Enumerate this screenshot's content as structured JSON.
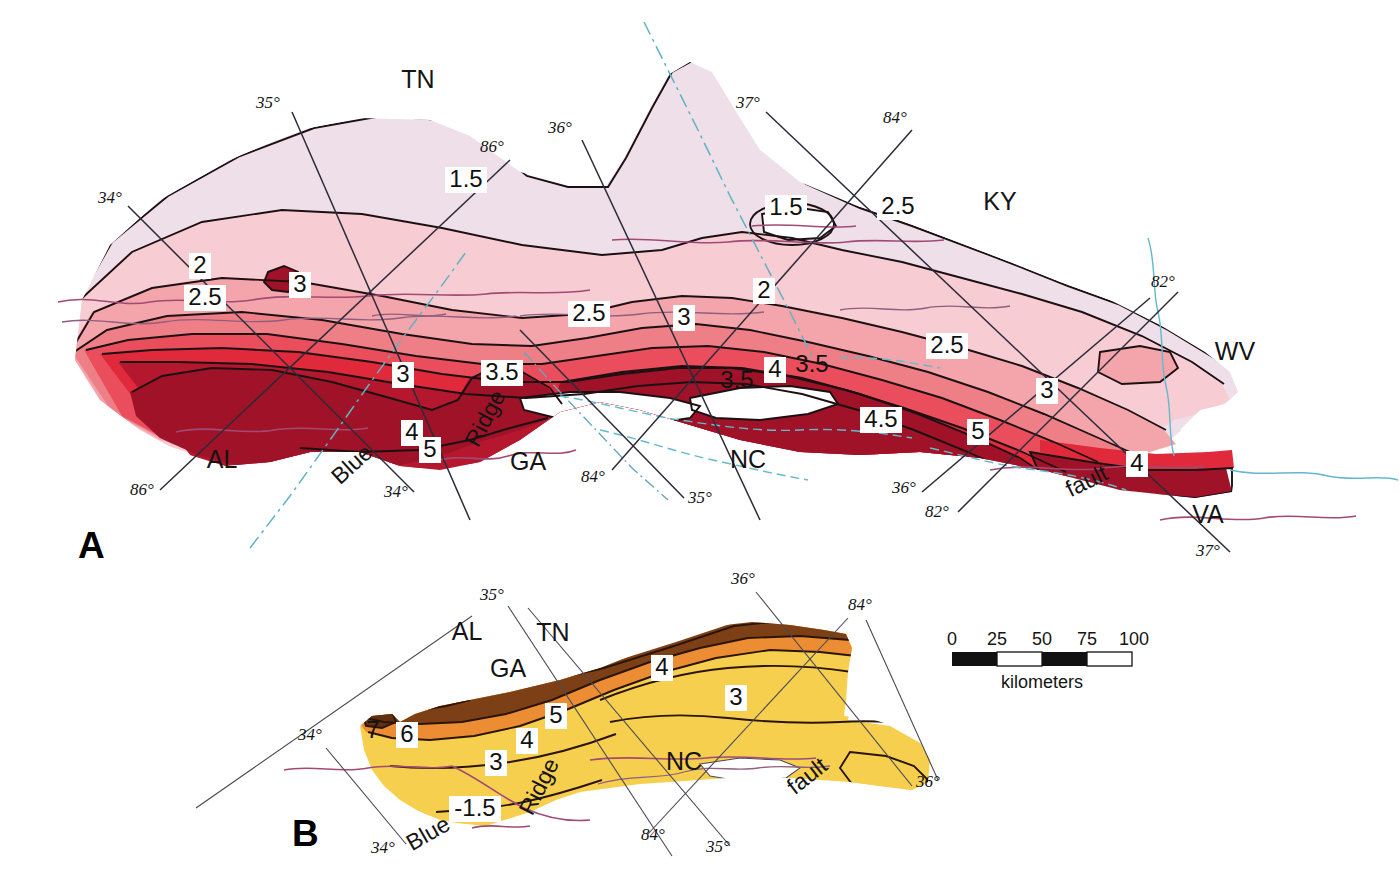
{
  "figure": {
    "type": "geologic-contour-map",
    "panels": [
      {
        "id": "A",
        "label": "A",
        "description": "Appalachian region isopach / thickness contour map, red color ramp",
        "state_labels": [
          {
            "text": "TN",
            "x": 418,
            "y": 88
          },
          {
            "text": "KY",
            "x": 1000,
            "y": 210
          },
          {
            "text": "WV",
            "x": 1235,
            "y": 360
          },
          {
            "text": "AL",
            "x": 222,
            "y": 468
          },
          {
            "text": "GA",
            "x": 528,
            "y": 470
          },
          {
            "text": "NC",
            "x": 748,
            "y": 468
          },
          {
            "text": "VA",
            "x": 1208,
            "y": 523
          }
        ],
        "feature_labels": [
          {
            "text": "Blue",
            "x": 357,
            "y": 470,
            "rotate": -42
          },
          {
            "text": "Ridge",
            "x": 492,
            "y": 422,
            "rotate": -62
          },
          {
            "text": "fault",
            "x": 1090,
            "y": 488,
            "rotate": -26
          }
        ],
        "degree_labels": [
          {
            "text": "35°",
            "x": 268,
            "y": 108
          },
          {
            "text": "86°",
            "x": 492,
            "y": 152
          },
          {
            "text": "36°",
            "x": 560,
            "y": 133
          },
          {
            "text": "37°",
            "x": 748,
            "y": 108
          },
          {
            "text": "84°",
            "x": 895,
            "y": 123
          },
          {
            "text": "34°",
            "x": 110,
            "y": 203
          },
          {
            "text": "82°",
            "x": 1163,
            "y": 287
          },
          {
            "text": "86°",
            "x": 142,
            "y": 495
          },
          {
            "text": "34°",
            "x": 396,
            "y": 497
          },
          {
            "text": "84°",
            "x": 593,
            "y": 482
          },
          {
            "text": "35°",
            "x": 700,
            "y": 503
          },
          {
            "text": "36°",
            "x": 904,
            "y": 493
          },
          {
            "text": "82°",
            "x": 937,
            "y": 517
          },
          {
            "text": "37°",
            "x": 1208,
            "y": 556
          }
        ],
        "contour_labels": [
          {
            "value": "1.5",
            "x": 465,
            "y": 182
          },
          {
            "value": "1.5",
            "x": 786,
            "y": 210
          },
          {
            "value": "2.5",
            "x": 898,
            "y": 209
          },
          {
            "value": "2",
            "x": 200,
            "y": 268
          },
          {
            "value": "3",
            "x": 300,
            "y": 287
          },
          {
            "value": "2.5",
            "x": 205,
            "y": 300
          },
          {
            "value": "2.5",
            "x": 589,
            "y": 316
          },
          {
            "value": "3",
            "x": 684,
            "y": 320
          },
          {
            "value": "2",
            "x": 764,
            "y": 293
          },
          {
            "value": "2.5",
            "x": 947,
            "y": 348
          },
          {
            "value": "3",
            "x": 403,
            "y": 377
          },
          {
            "value": "3.5",
            "x": 502,
            "y": 375
          },
          {
            "value": "3.5",
            "x": 737,
            "y": 383
          },
          {
            "value": "4",
            "x": 775,
            "y": 372
          },
          {
            "value": "3.5",
            "x": 812,
            "y": 367
          },
          {
            "value": "3",
            "x": 1047,
            "y": 393
          },
          {
            "value": "4",
            "x": 412,
            "y": 435
          },
          {
            "value": "5",
            "x": 430,
            "y": 452
          },
          {
            "value": "4.5",
            "x": 881,
            "y": 422
          },
          {
            "value": "5",
            "x": 978,
            "y": 434
          },
          {
            "value": "4",
            "x": 1137,
            "y": 466
          }
        ]
      },
      {
        "id": "B",
        "label": "B",
        "description": "Southern Appalachian thickness contour map, brown-orange-yellow color ramp",
        "state_labels": [
          {
            "text": "AL",
            "x": 467,
            "y": 640
          },
          {
            "text": "TN",
            "x": 553,
            "y": 641
          },
          {
            "text": "GA",
            "x": 508,
            "y": 677
          },
          {
            "text": "NC",
            "x": 684,
            "y": 770
          }
        ],
        "feature_labels": [
          {
            "text": "Blue",
            "x": 432,
            "y": 840,
            "rotate": -30
          },
          {
            "text": "Ridge",
            "x": 546,
            "y": 790,
            "rotate": -63
          },
          {
            "text": "fault",
            "x": 812,
            "y": 782,
            "rotate": -38
          }
        ],
        "degree_labels": [
          {
            "text": "35°",
            "x": 492,
            "y": 600
          },
          {
            "text": "36°",
            "x": 743,
            "y": 584
          },
          {
            "text": "84°",
            "x": 860,
            "y": 610
          },
          {
            "text": "34°",
            "x": 310,
            "y": 740
          },
          {
            "text": "34°",
            "x": 383,
            "y": 853
          },
          {
            "text": "84°",
            "x": 653,
            "y": 840
          },
          {
            "text": "35°",
            "x": 718,
            "y": 852
          },
          {
            "text": "36°",
            "x": 928,
            "y": 787
          }
        ],
        "contour_labels": [
          {
            "value": "4",
            "x": 662,
            "y": 670
          },
          {
            "value": "3",
            "x": 736,
            "y": 700
          },
          {
            "value": "5",
            "x": 556,
            "y": 718
          },
          {
            "value": "7",
            "x": 373,
            "y": 733
          },
          {
            "value": "6",
            "x": 407,
            "y": 737
          },
          {
            "value": "4",
            "x": 527,
            "y": 743
          },
          {
            "value": "3",
            "x": 496,
            "y": 765
          },
          {
            "value": "-1.5",
            "x": 475,
            "y": 811
          }
        ]
      }
    ],
    "scalebar": {
      "ticks": [
        "0",
        "25",
        "50",
        "75",
        "100"
      ],
      "caption": "kilometers",
      "segments": [
        "fill",
        "empty",
        "fill",
        "empty"
      ]
    },
    "colors": {
      "a_band1": "#efdde8",
      "a_band2": "#f6cfd4",
      "a_band3": "#f3a8ae",
      "a_band4": "#ef7f86",
      "a_band5": "#ea5560",
      "a_band6": "#e02c3c",
      "a_band7": "#b3172f",
      "a_band8": "#991227",
      "b_yellow": "#f6cf4d",
      "b_orange": "#ea8c32",
      "b_brown": "#7b3f16",
      "b_darkbrown": "#5d2f10",
      "graticule": "#2b2b3a",
      "river": "#a34a74",
      "stateline": "#5fb3c4"
    }
  }
}
